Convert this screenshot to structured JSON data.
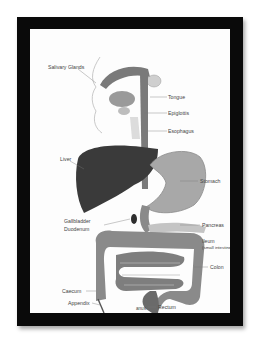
{
  "diagram": {
    "frame_color": "#0a0a0a",
    "labels": {
      "salivary_glands": "Salivary Glands",
      "tongue": "Tongue",
      "epiglottis": "Epiglottis",
      "esophagus": "Esophagus",
      "liver": "Liver",
      "stomach": "Stomach",
      "gallbladder": "Gallbladder",
      "duodenum": "Duodenum",
      "pancreas": "Pancreas",
      "ileum": "Ileum",
      "ileum_sub": "(small intestine)",
      "colon": "Colon",
      "caecum": "Caecum",
      "appendix": "Appendix",
      "rectum": "Rectum",
      "anus": "anus"
    },
    "colors": {
      "liver": "#3a3a3a",
      "stomach": "#a8a8a8",
      "intestine": "#8a8a8a",
      "esophagus": "#7a7a7a",
      "head": "#cfcfcf"
    }
  }
}
